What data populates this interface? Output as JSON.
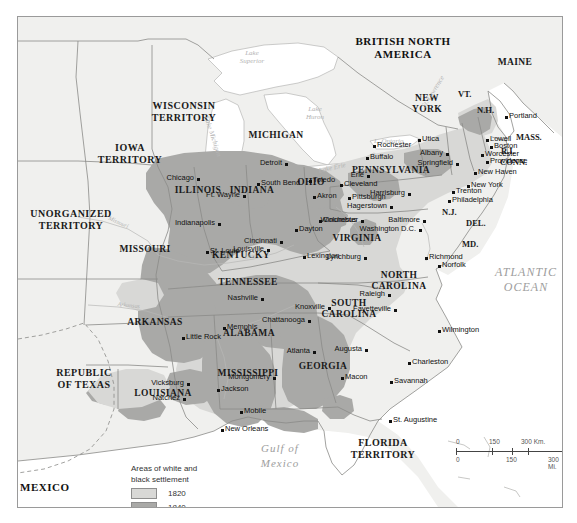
{
  "map": {
    "title_region": "Areas of white and black settlement, 1820 and 1840",
    "countries": [
      {
        "name": "BRITISH NORTH\nAMERICA",
        "line1": "BRITISH NORTH",
        "line2": "AMERICA"
      },
      {
        "name": "MEXICO",
        "line1": "MEXICO",
        "line2": ""
      }
    ],
    "country_british": "BRITISH NORTH",
    "country_british2": "AMERICA",
    "country_mexico": "MEXICO",
    "territories": [
      {
        "l1": "WISCONSIN",
        "l2": "TERRITORY"
      },
      {
        "l1": "IOWA",
        "l2": "TERRITORY"
      },
      {
        "l1": "UNORGANIZED",
        "l2": "TERRITORY"
      },
      {
        "l1": "REPUBLIC",
        "l2": "OF TEXAS"
      },
      {
        "l1": "FLORIDA",
        "l2": "TERRITORY"
      }
    ],
    "states": [
      {
        "l1": "MICHIGAN",
        "l2": ""
      },
      {
        "l1": "ILLINOIS",
        "l2": ""
      },
      {
        "l1": "INDIANA",
        "l2": ""
      },
      {
        "l1": "OHIO",
        "l2": ""
      },
      {
        "l1": "MISSOURI",
        "l2": ""
      },
      {
        "l1": "KENTUCKY",
        "l2": ""
      },
      {
        "l1": "TENNESSEE",
        "l2": ""
      },
      {
        "l1": "ARKANSAS",
        "l2": ""
      },
      {
        "l1": "ALABAMA",
        "l2": ""
      },
      {
        "l1": "MISSISSIPPI",
        "l2": ""
      },
      {
        "l1": "LOUISIANA",
        "l2": ""
      },
      {
        "l1": "GEORGIA",
        "l2": ""
      },
      {
        "l1": "SOUTH",
        "l2": "CAROLINA"
      },
      {
        "l1": "NORTH",
        "l2": "CAROLINA"
      },
      {
        "l1": "VIRGINIA",
        "l2": ""
      },
      {
        "l1": "PENNSYLVANIA",
        "l2": ""
      },
      {
        "l1": "NEW",
        "l2": "YORK"
      },
      {
        "l1": "MAINE",
        "l2": ""
      }
    ],
    "state_michigan": "MICHIGAN",
    "state_illinois": "ILLINOIS",
    "state_indiana": "INDIANA",
    "state_ohio": "OHIO",
    "state_missouri": "MISSOURI",
    "state_kentucky": "KENTUCKY",
    "state_tennessee": "TENNESSEE",
    "state_arkansas": "ARKANSAS",
    "state_alabama": "ALABAMA",
    "state_mississippi": "MISSISSIPPI",
    "state_louisiana": "LOUISIANA",
    "state_georgia": "GEORGIA",
    "state_sc1": "SOUTH",
    "state_sc2": "CAROLINA",
    "state_nc1": "NORTH",
    "state_nc2": "CAROLINA",
    "state_virginia": "VIRGINIA",
    "state_pennsylvania": "PENNSYLVANIA",
    "state_ny1": "NEW",
    "state_ny2": "YORK",
    "state_maine": "MAINE",
    "terr_wisconsin1": "WISCONSIN",
    "terr_wisconsin2": "TERRITORY",
    "terr_iowa1": "IOWA",
    "terr_iowa2": "TERRITORY",
    "terr_unorg1": "UNORGANIZED",
    "terr_unorg2": "TERRITORY",
    "terr_texas1": "REPUBLIC",
    "terr_texas2": "OF TEXAS",
    "terr_florida1": "FLORIDA",
    "terr_florida2": "TERRITORY",
    "abbrev": {
      "vt": "VT.",
      "nh": "N.H.",
      "mass": "MASS.",
      "ri": "R.I.",
      "conn": "CONN.",
      "nj": "N.J.",
      "del": "DEL.",
      "md": "MD."
    },
    "waters": {
      "lake_superior1": "Lake",
      "lake_superior2": "Superior",
      "lake_michigan": "Lake Michigan",
      "lake_huron1": "Lake",
      "lake_huron2": "Huron",
      "lake_erie": "Lake Erie",
      "lake_ontario": "L. Ontario",
      "st_lawrence": "St. Lawrence",
      "atlantic1": "ATLANTIC",
      "atlantic2": "OCEAN",
      "gulf1": "Gulf of",
      "gulf2": "Mexico",
      "missouri_river": "Missouri",
      "ohio_river": "Ohio",
      "arkansas_river": "Arkansas",
      "tennessee_river": "Tennessee",
      "mississippi_river": "Mississippi"
    },
    "cities": [
      {
        "name": "Chicago",
        "x": 179,
        "y": 161,
        "anchor": "right"
      },
      {
        "name": "South Bend",
        "x": 239,
        "y": 166,
        "anchor": "left"
      },
      {
        "name": "Ft. Wayne",
        "x": 225,
        "y": 178,
        "anchor": "right"
      },
      {
        "name": "Detroit",
        "x": 267,
        "y": 146,
        "anchor": "right"
      },
      {
        "name": "Toledo",
        "x": 291,
        "y": 163,
        "anchor": "left"
      },
      {
        "name": "Cleveland",
        "x": 322,
        "y": 167,
        "anchor": "left"
      },
      {
        "name": "Akron",
        "x": 295,
        "y": 179,
        "anchor": "left"
      },
      {
        "name": "Pittsburgh",
        "x": 330,
        "y": 180,
        "anchor": "left"
      },
      {
        "name": "Indianapolis",
        "x": 200,
        "y": 206,
        "anchor": "right"
      },
      {
        "name": "Columbus",
        "x": 301,
        "y": 203,
        "anchor": "left"
      },
      {
        "name": "Dayton",
        "x": 277,
        "y": 212,
        "anchor": "left"
      },
      {
        "name": "Cincinnati",
        "x": 262,
        "y": 224,
        "anchor": "right"
      },
      {
        "name": "Louisville",
        "x": 249,
        "y": 232,
        "anchor": "right"
      },
      {
        "name": "St. Louis",
        "x": 188,
        "y": 234,
        "anchor": "left"
      },
      {
        "name": "Lexington",
        "x": 285,
        "y": 239,
        "anchor": "left"
      },
      {
        "name": "Winchester",
        "x": 343,
        "y": 203,
        "anchor": "right"
      },
      {
        "name": "Hagerstown",
        "x": 372,
        "y": 189,
        "anchor": "right"
      },
      {
        "name": "Harrisburg",
        "x": 390,
        "y": 176,
        "anchor": "right"
      },
      {
        "name": "Baltimore",
        "x": 405,
        "y": 203,
        "anchor": "right"
      },
      {
        "name": "Washington D.C.",
        "x": 401,
        "y": 212,
        "anchor": "right"
      },
      {
        "name": "Philadelphia",
        "x": 430,
        "y": 183,
        "anchor": "left"
      },
      {
        "name": "Trenton",
        "x": 434,
        "y": 174,
        "anchor": "left"
      },
      {
        "name": "New York",
        "x": 449,
        "y": 168,
        "anchor": "left"
      },
      {
        "name": "New Haven",
        "x": 456,
        "y": 155,
        "anchor": "left"
      },
      {
        "name": "Providence",
        "x": 468,
        "y": 144,
        "anchor": "left"
      },
      {
        "name": "Worcester",
        "x": 463,
        "y": 137,
        "anchor": "left"
      },
      {
        "name": "Boston",
        "x": 472,
        "y": 129,
        "anchor": "left"
      },
      {
        "name": "Lowell",
        "x": 468,
        "y": 122,
        "anchor": "left"
      },
      {
        "name": "Portland",
        "x": 487,
        "y": 99,
        "anchor": "left"
      },
      {
        "name": "Springfield",
        "x": 438,
        "y": 146,
        "anchor": "right"
      },
      {
        "name": "Albany",
        "x": 428,
        "y": 136,
        "anchor": "right"
      },
      {
        "name": "Utica",
        "x": 400,
        "y": 122,
        "anchor": "left"
      },
      {
        "name": "Rochester",
        "x": 355,
        "y": 128,
        "anchor": "left"
      },
      {
        "name": "Buffalo",
        "x": 348,
        "y": 140,
        "anchor": "left"
      },
      {
        "name": "Erie",
        "x": 349,
        "y": 158,
        "anchor": "right"
      },
      {
        "name": "Richmond",
        "x": 407,
        "y": 240,
        "anchor": "left"
      },
      {
        "name": "Norfolk",
        "x": 420,
        "y": 248,
        "anchor": "left"
      },
      {
        "name": "Lynchburg",
        "x": 346,
        "y": 240,
        "anchor": "right"
      },
      {
        "name": "Raleigh",
        "x": 370,
        "y": 277,
        "anchor": "right"
      },
      {
        "name": "Fayetteville",
        "x": 376,
        "y": 292,
        "anchor": "right"
      },
      {
        "name": "Wilmington",
        "x": 420,
        "y": 313,
        "anchor": "left"
      },
      {
        "name": "Charleston",
        "x": 390,
        "y": 345,
        "anchor": "left"
      },
      {
        "name": "Savannah",
        "x": 372,
        "y": 364,
        "anchor": "left"
      },
      {
        "name": "Augusta",
        "x": 347,
        "y": 332,
        "anchor": "right"
      },
      {
        "name": "Macon",
        "x": 323,
        "y": 360,
        "anchor": "left"
      },
      {
        "name": "Atlanta",
        "x": 295,
        "y": 334,
        "anchor": "right"
      },
      {
        "name": "Knoxville",
        "x": 310,
        "y": 290,
        "anchor": "right"
      },
      {
        "name": "Chattanooga",
        "x": 290,
        "y": 303,
        "anchor": "right"
      },
      {
        "name": "Nashville",
        "x": 243,
        "y": 281,
        "anchor": "right"
      },
      {
        "name": "Memphis",
        "x": 205,
        "y": 310,
        "anchor": "left"
      },
      {
        "name": "Little Rock",
        "x": 164,
        "y": 320,
        "anchor": "left"
      },
      {
        "name": "Vicksburg",
        "x": 169,
        "y": 366,
        "anchor": "right"
      },
      {
        "name": "Natchez",
        "x": 165,
        "y": 381,
        "anchor": "right"
      },
      {
        "name": "Jackson",
        "x": 199,
        "y": 372,
        "anchor": "left"
      },
      {
        "name": "Montgomery",
        "x": 255,
        "y": 360,
        "anchor": "right"
      },
      {
        "name": "Mobile",
        "x": 222,
        "y": 394,
        "anchor": "left"
      },
      {
        "name": "New Orleans",
        "x": 203,
        "y": 412,
        "anchor": "left"
      },
      {
        "name": "St. Augustine",
        "x": 371,
        "y": 403,
        "anchor": "left"
      }
    ]
  },
  "legend": {
    "title_line1": "Areas of white and",
    "title_line2": "black settlement",
    "entries": [
      {
        "year": "1820",
        "color": "#d8d8d6"
      },
      {
        "year": "1840",
        "color": "#a9a9a7"
      }
    ],
    "year_1820": "1820",
    "year_1840": "1840"
  },
  "scale": {
    "km_0": "0",
    "km_150": "150",
    "km_300": "300 Km.",
    "mi_0": "0",
    "mi_150": "150",
    "mi_300": "300 Mi."
  },
  "colors": {
    "settle_1820": "#d8d8d6",
    "settle_1840": "#a9a9a7",
    "land": "#f0f0ee",
    "water": "#ffffff",
    "border": "#8a8a88"
  }
}
